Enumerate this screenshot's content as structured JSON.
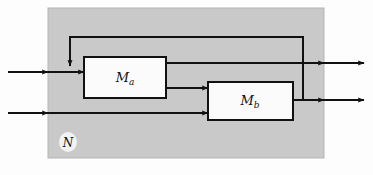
{
  "diagram": {
    "type": "block-diagram",
    "canvas": {
      "width": 373,
      "height": 175,
      "background": "#fdfdfd"
    },
    "panel": {
      "name": "N",
      "label": "N",
      "label_main": "N",
      "fill": "#c9c9c9",
      "stroke": "#b0b0b0",
      "x": 48,
      "y": 8,
      "width": 276,
      "height": 150,
      "label_x": 68,
      "label_y": 146,
      "label_badge_fill": "#f2f2f2"
    },
    "blocks": [
      {
        "name": "Ma",
        "label_main": "M",
        "label_sub": "a",
        "x": 84,
        "y": 57,
        "width": 82,
        "height": 41,
        "fill": "#fbfbfb",
        "stroke": "#111111",
        "label_x": 125,
        "label_y": 82
      },
      {
        "name": "Mb",
        "label_main": "M",
        "label_sub": "b",
        "x": 208,
        "y": 82,
        "width": 85,
        "height": 38,
        "fill": "#fbfbfb",
        "stroke": "#111111",
        "label_x": 250,
        "label_y": 105
      }
    ],
    "signals": {
      "input_top_label": "input-line-top",
      "input_bottom_label": "input-line-bottom",
      "output_top_label": "output-line-top",
      "output_bottom_label": "output-line-bottom",
      "feedback_label": "feedback-line",
      "internal_a_to_b_label": "ma-to-mb-line"
    },
    "geometry": {
      "input_top_y": 72,
      "input_bottom_y": 113,
      "output_top_y": 63,
      "output_bottom_y": 100,
      "feedback_top_y": 37,
      "feedback_left_x": 70,
      "feedback_right_x": 303,
      "ma_out_low_y": 88,
      "line_left_start_x": 8,
      "line_right_end_x": 364,
      "panel_left_x": 48,
      "panel_right_x": 324
    },
    "colors": {
      "line": "#111111",
      "panel_fill": "#c9c9c9",
      "box_fill": "#fbfbfb",
      "page_background": "#fdfdfd"
    }
  }
}
